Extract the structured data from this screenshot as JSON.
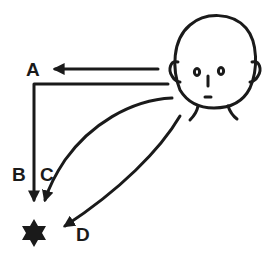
{
  "diagram": {
    "labels": {
      "a": "A",
      "b": "B",
      "c": "C",
      "d": "D"
    },
    "nodes": [
      {
        "id": "face",
        "type": "human-head-icon"
      },
      {
        "id": "star",
        "type": "six-pointed-star",
        "color": "#1a1a1a"
      }
    ],
    "edges": [
      {
        "label": "A",
        "from": "face",
        "to": "label-A",
        "shape": "straight-left"
      },
      {
        "label": "B",
        "from": "face",
        "to": "star",
        "shape": "L-shaped"
      },
      {
        "label": "C",
        "from": "face",
        "to": "star",
        "shape": "curve"
      },
      {
        "label": "D",
        "from": "face",
        "to": "star",
        "shape": "curve"
      }
    ],
    "stroke_color": "#1a1a1a",
    "background": "#ffffff"
  }
}
